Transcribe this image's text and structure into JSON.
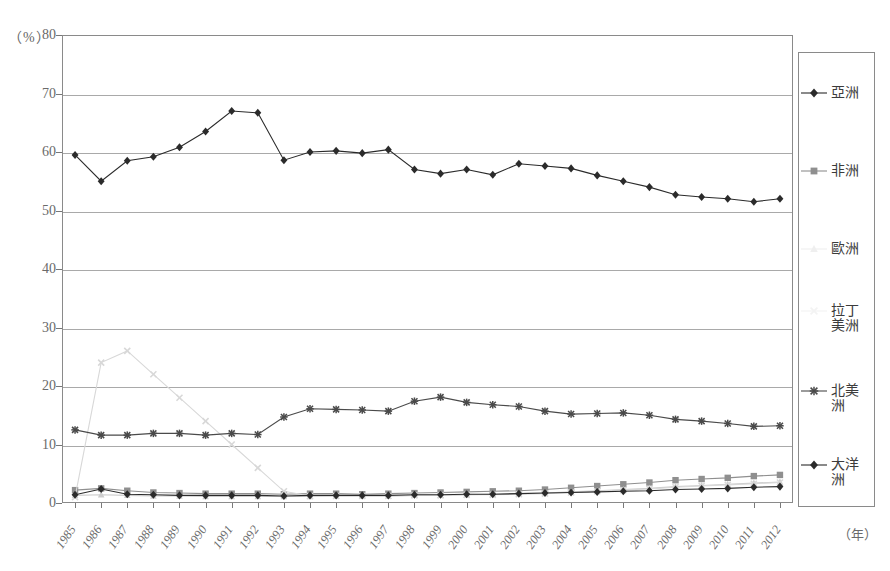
{
  "chart_data": {
    "type": "line",
    "title": "",
    "xlabel": "年",
    "ylabel": "%",
    "ylim": [
      0,
      80
    ],
    "ytick_step": 10,
    "grid": true,
    "legend_position": "right",
    "x": [
      "1985",
      "1986",
      "1987",
      "1988",
      "1989",
      "1990",
      "1991",
      "1992",
      "1993",
      "1994",
      "1995",
      "1996",
      "1997",
      "1998",
      "1999",
      "2000",
      "2001",
      "2002",
      "2003",
      "2004",
      "2005",
      "2006",
      "2007",
      "2008",
      "2009",
      "2010",
      "2011",
      "2012"
    ],
    "yticks": [
      "0",
      "10",
      "20",
      "30",
      "40",
      "50",
      "60",
      "70",
      "80"
    ],
    "series": [
      {
        "name": "亞洲",
        "marker": "diamond",
        "color": "#2b2b2b",
        "values": [
          59.5,
          55.0,
          58.5,
          59.2,
          60.8,
          63.5,
          67.0,
          66.7,
          58.6,
          60.0,
          60.2,
          59.8,
          60.4,
          57.0,
          56.3,
          57.0,
          56.1,
          58.0,
          57.6,
          57.2,
          56.0,
          55.0,
          54.0,
          52.7,
          52.3,
          52.0,
          51.5,
          52.0
        ]
      },
      {
        "name": "非洲",
        "marker": "square",
        "color": "#8f8f8f",
        "values": [
          2.2,
          2.5,
          2.1,
          1.8,
          1.7,
          1.6,
          1.6,
          1.6,
          1.5,
          1.6,
          1.6,
          1.5,
          1.6,
          1.7,
          1.8,
          1.9,
          2.0,
          2.1,
          2.3,
          2.6,
          2.9,
          3.2,
          3.5,
          3.9,
          4.1,
          4.3,
          4.6,
          4.8
        ]
      },
      {
        "name": "歐洲",
        "marker": "triangle",
        "color": "#cccccc",
        "values": [
          1.3,
          1.4,
          1.3,
          1.2,
          1.2,
          1.1,
          1.1,
          1.1,
          1.1,
          1.1,
          1.2,
          1.2,
          1.2,
          1.3,
          1.3,
          1.4,
          1.5,
          1.6,
          1.7,
          1.9,
          2.1,
          2.3,
          2.5,
          2.8,
          3.0,
          3.2,
          3.4,
          3.6
        ]
      },
      {
        "name": "拉丁美洲",
        "marker": "cross",
        "color": "#d8d8d8",
        "values": [
          1.0,
          24.0,
          26.0,
          22.0,
          18.0,
          14.0,
          10.0,
          6.0,
          2.0,
          1.2,
          1.2,
          1.2,
          1.2,
          1.3,
          1.3,
          1.4,
          1.4,
          1.5,
          1.6,
          1.8,
          2.0,
          2.2,
          2.4,
          2.7,
          2.9,
          3.1,
          3.3,
          3.5
        ]
      },
      {
        "name": "北美洲",
        "marker": "star",
        "color": "#4a4a4a",
        "values": [
          12.5,
          11.6,
          11.6,
          11.9,
          11.9,
          11.6,
          11.9,
          11.7,
          14.7,
          16.1,
          16.0,
          15.9,
          15.7,
          17.4,
          18.1,
          17.2,
          16.8,
          16.5,
          15.7,
          15.2,
          15.3,
          15.4,
          15.0,
          14.3,
          14.0,
          13.6,
          13.1,
          13.2
        ]
      },
      {
        "name": "大洋洲",
        "marker": "diamond",
        "color": "#2b2b2b",
        "values": [
          1.4,
          2.4,
          1.5,
          1.4,
          1.3,
          1.3,
          1.3,
          1.3,
          1.2,
          1.3,
          1.3,
          1.3,
          1.3,
          1.4,
          1.4,
          1.5,
          1.5,
          1.6,
          1.7,
          1.8,
          1.9,
          2.0,
          2.1,
          2.3,
          2.4,
          2.5,
          2.7,
          2.8
        ]
      }
    ]
  },
  "axis": {
    "unit_label": "（%）",
    "x_unit_label": "（年）"
  },
  "legend": {
    "items": [
      {
        "label_line1": "亞洲",
        "label_line2": ""
      },
      {
        "label_line1": "非洲",
        "label_line2": ""
      },
      {
        "label_line1": "歐洲",
        "label_line2": ""
      },
      {
        "label_line1": "拉丁",
        "label_line2": "美洲"
      },
      {
        "label_line1": "北美",
        "label_line2": "洲"
      },
      {
        "label_line1": "大洋",
        "label_line2": "洲"
      }
    ]
  }
}
